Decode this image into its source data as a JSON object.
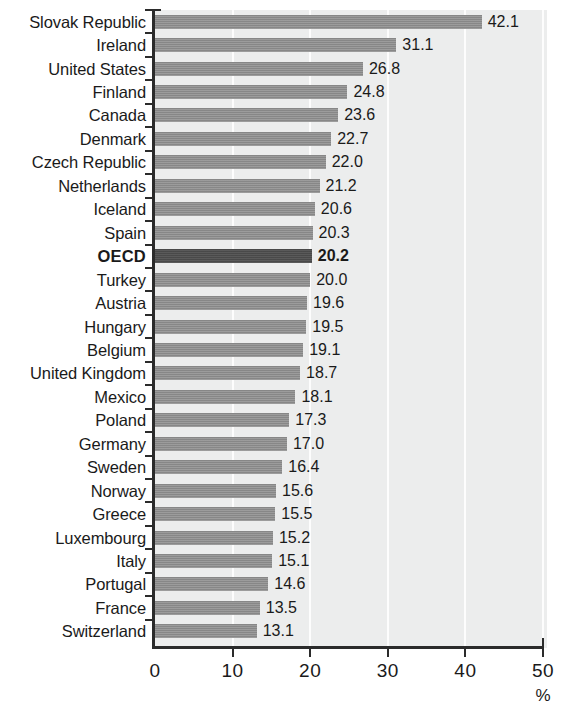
{
  "chart_data": {
    "type": "bar",
    "orientation": "horizontal",
    "title": "",
    "subtitle": "",
    "xlabel": "%",
    "ylabel": "",
    "xlim": [
      0,
      50
    ],
    "xticks": [
      0,
      10,
      20,
      30,
      40,
      50
    ],
    "xtick_labels": [
      "0",
      "10",
      "20",
      "30",
      "40",
      "50"
    ],
    "grid": true,
    "grid_axis": "x",
    "legend": false,
    "highlight_category": "OECD",
    "bar_color": "#8e8e8e",
    "highlight_bar_color": "#4e4e4e",
    "plot_background": "#eceded",
    "axis_color": "#2b2b2b",
    "categories": [
      "Slovak Republic",
      "Ireland",
      "United States",
      "Finland",
      "Canada",
      "Denmark",
      "Czech Republic",
      "Netherlands",
      "Iceland",
      "Spain",
      "OECD",
      "Turkey",
      "Austria",
      "Hungary",
      "Belgium",
      "United Kingdom",
      "Mexico",
      "Poland",
      "Germany",
      "Sweden",
      "Norway",
      "Greece",
      "Luxembourg",
      "Italy",
      "Portugal",
      "France",
      "Switzerland"
    ],
    "values": [
      42.1,
      31.1,
      26.8,
      24.8,
      23.6,
      22.7,
      22.0,
      21.2,
      20.6,
      20.3,
      20.2,
      20.0,
      19.6,
      19.5,
      19.1,
      18.7,
      18.1,
      17.3,
      17.0,
      16.4,
      15.6,
      15.5,
      15.2,
      15.1,
      14.6,
      13.5,
      13.1
    ],
    "value_labels": [
      "42.1",
      "31.1",
      "26.8",
      "24.8",
      "23.6",
      "22.7",
      "22.0",
      "21.2",
      "20.6",
      "20.3",
      "20.2",
      "20.0",
      "19.6",
      "19.5",
      "19.1",
      "18.7",
      "18.1",
      "17.3",
      "17.0",
      "16.4",
      "15.6",
      "15.5",
      "15.2",
      "15.1",
      "14.6",
      "13.5",
      "13.1"
    ]
  },
  "axis": {
    "unit_label": "%"
  }
}
